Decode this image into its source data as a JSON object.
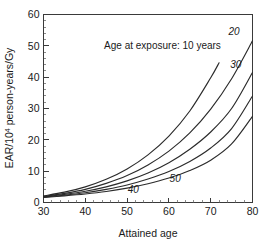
{
  "chart_data": {
    "type": "line",
    "title": "",
    "xlabel": "Attained age",
    "ylabel": "EAR/10⁴ person-years/Gy",
    "ylabel_base": "EAR/10",
    "ylabel_sup": "4",
    "ylabel_tail": " person-years/Gy",
    "xlim": [
      30,
      80
    ],
    "ylim": [
      0,
      60
    ],
    "xticks": [
      30,
      40,
      50,
      60,
      70,
      80
    ],
    "yticks": [
      0,
      10,
      20,
      30,
      40,
      50,
      60
    ],
    "xtick_labels": [
      "30",
      "40",
      "50",
      "60",
      "70",
      "80"
    ],
    "ytick_labels": [
      "0",
      "10",
      "20",
      "30",
      "40",
      "50",
      "60"
    ],
    "x_minor_step": 2,
    "y_minor_step": 2,
    "grid": false,
    "legend": "inline-curve-labels",
    "annotation": "Age at exposure: 10 years",
    "line_color": "#2b2b2b",
    "series": [
      {
        "name": "10",
        "label": "10 years",
        "x": [
          30,
          35,
          40,
          45,
          50,
          55,
          60,
          65,
          70,
          72
        ],
        "values": [
          2.1,
          3.3,
          5.0,
          7.4,
          10.7,
          15.2,
          21.2,
          29.2,
          39.8,
          44.6
        ]
      },
      {
        "name": "20",
        "label": "20",
        "x": [
          30,
          35,
          40,
          45,
          50,
          55,
          60,
          65,
          70,
          75,
          80
        ],
        "values": [
          1.9,
          2.9,
          4.2,
          6.1,
          8.6,
          12.0,
          16.4,
          22.2,
          29.8,
          39.5,
          51.6
        ]
      },
      {
        "name": "30",
        "label": "30",
        "x": [
          30,
          35,
          40,
          45,
          50,
          55,
          60,
          65,
          70,
          75,
          80
        ],
        "values": [
          1.8,
          2.6,
          3.6,
          5.0,
          6.9,
          9.4,
          12.7,
          17.0,
          22.5,
          30.0,
          41.5
        ]
      },
      {
        "name": "40",
        "label": "40",
        "x": [
          30,
          35,
          40,
          45,
          50,
          55,
          60,
          65,
          70,
          75,
          80
        ],
        "values": [
          1.7,
          2.3,
          3.1,
          4.2,
          5.6,
          7.5,
          9.9,
          13.1,
          17.4,
          23.6,
          34.0
        ]
      },
      {
        "name": "50",
        "label": "50",
        "x": [
          30,
          35,
          40,
          45,
          50,
          55,
          60,
          65,
          70,
          75,
          80
        ],
        "values": [
          1.6,
          2.1,
          2.7,
          3.5,
          4.6,
          6.0,
          7.8,
          10.2,
          13.5,
          18.7,
          27.5
        ]
      }
    ],
    "curve_labels": [
      {
        "text": "20",
        "x": 75.6,
        "y": 53.5
      },
      {
        "text": "30",
        "x": 76.0,
        "y": 43.0
      },
      {
        "text": "40",
        "x": 51.5,
        "y": 3.0
      },
      {
        "text": "50",
        "x": 61.5,
        "y": 6.6
      }
    ],
    "annotation_position": {
      "x": 44.5,
      "y": 49.0
    }
  }
}
